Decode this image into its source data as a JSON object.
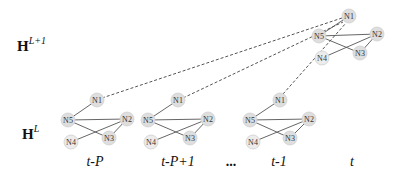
{
  "layers": {
    "upper": {
      "label": "H",
      "superscript": "L+1"
    },
    "lower": {
      "label": "H",
      "superscript": "L"
    }
  },
  "time_labels": [
    "t-P",
    "t-P+1",
    "...",
    "t-1",
    "t"
  ],
  "node_labels": [
    "N1",
    "N2",
    "N3",
    "N4",
    "N5"
  ],
  "edges": [
    [
      "N1",
      "N5"
    ],
    [
      "N5",
      "N2"
    ],
    [
      "N5",
      "N3"
    ],
    [
      "N4",
      "N2"
    ],
    [
      "N2",
      "N3"
    ]
  ],
  "graphs": [
    {
      "time": "t-P",
      "layer": "L"
    },
    {
      "time": "t-P+1",
      "layer": "L"
    },
    {
      "time": "t-1",
      "layer": "L"
    },
    {
      "time": "t",
      "layer": "L+1"
    }
  ],
  "connections": "dashed lines from N1 of each layer-L graph to N1 of layer-(L+1) graph",
  "colors": {
    "node_fill": "#dedede",
    "edge": "#555555",
    "text": "#111111"
  }
}
